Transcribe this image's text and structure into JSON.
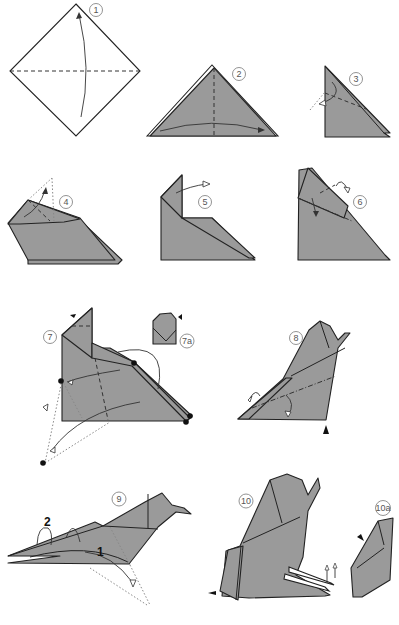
{
  "diagram": {
    "type": "origami-instructions",
    "steps": [
      {
        "id": "1",
        "label": "1"
      },
      {
        "id": "2",
        "label": "2"
      },
      {
        "id": "3",
        "label": "3"
      },
      {
        "id": "4",
        "label": "4"
      },
      {
        "id": "5",
        "label": "5"
      },
      {
        "id": "6",
        "label": "6"
      },
      {
        "id": "7",
        "label": "7"
      },
      {
        "id": "7a",
        "label": "7a"
      },
      {
        "id": "8",
        "label": "8"
      },
      {
        "id": "9",
        "label": "9"
      },
      {
        "id": "10",
        "label": "10"
      },
      {
        "id": "10a",
        "label": "10a"
      }
    ],
    "annotations": {
      "step9_sub1": "1",
      "step9_sub2": "2"
    },
    "colors": {
      "paper": "#9a9a9a",
      "outline": "#222222",
      "background": "#ffffff"
    }
  }
}
